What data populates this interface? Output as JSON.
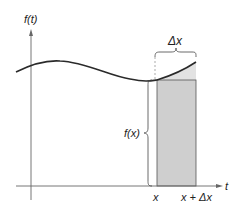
{
  "diagram": {
    "type": "riemann-sum-strip",
    "labels": {
      "y_axis": "f(t)",
      "x_axis": "t",
      "x_left": "x",
      "x_right": "x + Δx",
      "height": "f(x)",
      "width": "Δx"
    },
    "colors": {
      "curve": "#2a2a2a",
      "axis": "#666666",
      "rect_fill": "#cfcfcf",
      "rect_stroke": "#555555",
      "brace": "#444444"
    }
  }
}
